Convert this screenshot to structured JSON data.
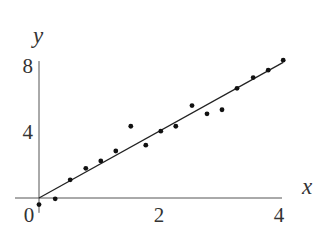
{
  "chart_data": {
    "type": "scatter",
    "title": "",
    "xlabel": "x",
    "ylabel": "y",
    "xlim": [
      0,
      4.1
    ],
    "ylim": [
      -0.5,
      8.6
    ],
    "grid": false,
    "legend": "none",
    "x_ticks": [
      {
        "value": 0,
        "label": "0"
      },
      {
        "value": 2,
        "label": "2"
      },
      {
        "value": 4,
        "label": "4"
      }
    ],
    "y_ticks": [
      {
        "value": 4,
        "label": "4"
      },
      {
        "value": 8,
        "label": "8"
      }
    ],
    "series": [
      {
        "name": "data",
        "x": [
          0,
          0.27,
          0.52,
          0.78,
          1.03,
          1.28,
          1.53,
          1.78,
          2.03,
          2.28,
          2.55,
          2.8,
          3.05,
          3.3,
          3.57,
          3.82,
          4.07
        ],
        "y": [
          -0.4,
          -0.05,
          1.1,
          1.8,
          2.25,
          2.85,
          4.35,
          3.2,
          4.05,
          4.35,
          5.6,
          5.1,
          5.35,
          6.65,
          7.3,
          7.75,
          8.35
        ]
      }
    ],
    "fit_line": {
      "name": "best fit",
      "slope": 2.02,
      "intercept": 0,
      "x_range": [
        0,
        4.07
      ]
    }
  }
}
